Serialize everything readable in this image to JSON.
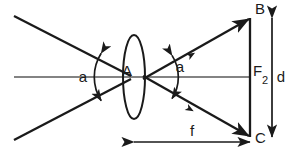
{
  "figure": {
    "kind": "optics-ray-diagram",
    "title": "",
    "background_color": "#ffffff",
    "ink_color": "#1a1a1a",
    "axis_color": "#5a5a5a"
  },
  "labels": {
    "lens_center": "A",
    "angle_left": "a",
    "angle_right": "a",
    "point_top": "B",
    "point_bottom": "C",
    "focal_point": "F",
    "focal_point_subscript": "2",
    "distance_vertical": "d",
    "distance_horizontal": "f"
  },
  "geometry": {
    "canvas": {
      "width": 291,
      "height": 154
    },
    "optical_axis": {
      "x1": 14,
      "y1": 77,
      "x2": 250,
      "y2": 77
    },
    "lens": {
      "cx": 134,
      "cy": 77,
      "rx": 11,
      "ry": 42
    },
    "crossing_point": {
      "x": 137,
      "y": 77
    },
    "ray_upper": {
      "x1": 14,
      "y1": 16,
      "x2": 250,
      "y2": 18,
      "arrow_at": "x2"
    },
    "ray_lower": {
      "x1": 14,
      "y1": 140,
      "x2": 250,
      "y2": 137,
      "arrow_at": "x2"
    },
    "screen_line": {
      "x1": 250,
      "y1": 18,
      "x2": 250,
      "y2": 137
    },
    "arc_left": {
      "radius": 44,
      "center": {
        "x": 137,
        "y": 77
      }
    },
    "arc_right": {
      "radius": 40,
      "center": {
        "x": 137,
        "y": 77
      }
    },
    "dim_d": {
      "x": 272,
      "y1": 18,
      "y2": 137
    },
    "dim_f": {
      "y": 142,
      "x1": 134,
      "x2": 250
    }
  }
}
